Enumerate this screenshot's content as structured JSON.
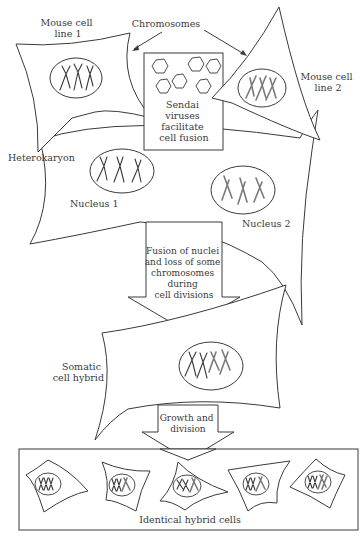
{
  "diagram": {
    "type": "flow",
    "labels": {
      "mouse_cell_line_1": [
        "Mouse cell",
        "line 1"
      ],
      "chromosomes": "Chromosomes",
      "mouse_cell_line_2": [
        "Mouse cell",
        "line 2"
      ],
      "sendai": [
        "Sendai",
        "viruses",
        "facilitate",
        "cell fusion"
      ],
      "heterokaryon": "Heterokaryon",
      "nucleus_1": "Nucleus 1",
      "nucleus_2": "Nucleus 2",
      "fusion_step": [
        "Fusion of nuclei",
        "and loss of some",
        "chromosomes",
        "during",
        "cell divisions"
      ],
      "somatic_cell_hybrid": [
        "Somatic",
        "cell hybrid"
      ],
      "growth_step": [
        "Growth  and",
        "division"
      ],
      "identical_hybrid_cells": "Identical hybrid  cells"
    },
    "nodes": [
      {
        "id": "cell1",
        "label": "Mouse cell line 1",
        "chromosome_color": "dark"
      },
      {
        "id": "cell2",
        "label": "Mouse cell line 2",
        "chromosome_color": "gray"
      },
      {
        "id": "virus",
        "label": "Sendai viruses facilitate cell fusion"
      },
      {
        "id": "heterokaryon",
        "label": "Heterokaryon",
        "contains": [
          "Nucleus 1",
          "Nucleus 2"
        ]
      },
      {
        "id": "hybrid",
        "label": "Somatic cell hybrid"
      },
      {
        "id": "clones",
        "label": "Identical hybrid cells",
        "count": 5
      }
    ],
    "edges": [
      {
        "from": "cell1",
        "to": "heterokaryon"
      },
      {
        "from": "cell2",
        "to": "heterokaryon"
      },
      {
        "from": "heterokaryon",
        "to": "hybrid",
        "label": "Fusion of nuclei and loss of some chromosomes during cell divisions"
      },
      {
        "from": "hybrid",
        "to": "clones",
        "label": "Growth and division"
      }
    ],
    "colors": {
      "line": "#3a3a3a",
      "chromosome_line1": "#3a3a3a",
      "chromosome_line2": "#7a7a7a",
      "background": "#ffffff"
    }
  }
}
